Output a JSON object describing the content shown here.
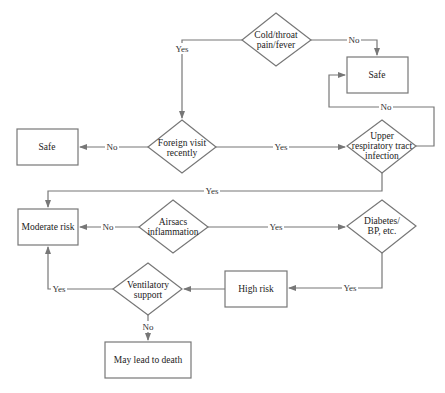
{
  "colors": {
    "stroke": "#777777",
    "text": "#222222",
    "background": "#ffffff"
  },
  "nodes": {
    "cold": {
      "type": "decision",
      "lines": [
        "Cold/throat",
        "pain/fever"
      ]
    },
    "safe_top": {
      "type": "process",
      "lines": [
        "Safe"
      ]
    },
    "foreign": {
      "type": "decision",
      "lines": [
        "Foreign visit",
        "recently"
      ]
    },
    "safe_left": {
      "type": "process",
      "lines": [
        "Safe"
      ]
    },
    "upper": {
      "type": "decision",
      "lines": [
        "Upper",
        "respiratory tract",
        "infection"
      ]
    },
    "moderate": {
      "type": "process",
      "lines": [
        "Moderate risk"
      ]
    },
    "airsacs": {
      "type": "decision",
      "lines": [
        "Airsacs",
        "inflammation"
      ]
    },
    "diabetes": {
      "type": "decision",
      "lines": [
        "Diabetes/",
        "BP, etc."
      ]
    },
    "high": {
      "type": "process",
      "lines": [
        "High risk"
      ]
    },
    "ventilatory": {
      "type": "decision",
      "lines": [
        "Ventilatory",
        "support"
      ]
    },
    "death": {
      "type": "process",
      "lines": [
        "May lead to death"
      ]
    }
  },
  "edges": {
    "cold_yes": {
      "from": "cold",
      "to": "foreign",
      "label": "Yes"
    },
    "cold_no": {
      "from": "cold",
      "to": "safe_top",
      "label": "No"
    },
    "foreign_no": {
      "from": "foreign",
      "to": "safe_left",
      "label": "No"
    },
    "foreign_yes": {
      "from": "foreign",
      "to": "upper",
      "label": "Yes"
    },
    "upper_no": {
      "from": "upper",
      "to": "safe_top",
      "label": "No"
    },
    "upper_yes": {
      "from": "upper",
      "to": "moderate",
      "label": "Yes"
    },
    "airsacs_no": {
      "from": "airsacs",
      "to": "moderate",
      "label": "No"
    },
    "airsacs_yes": {
      "from": "airsacs",
      "to": "diabetes",
      "label": "Yes"
    },
    "diabetes_yes": {
      "from": "diabetes",
      "to": "high",
      "label": "Yes"
    },
    "high_to_vent": {
      "from": "high",
      "to": "ventilatory",
      "label": ""
    },
    "vent_yes": {
      "from": "ventilatory",
      "to": "moderate",
      "label": "Yes"
    },
    "vent_no": {
      "from": "ventilatory",
      "to": "death",
      "label": "No"
    }
  }
}
